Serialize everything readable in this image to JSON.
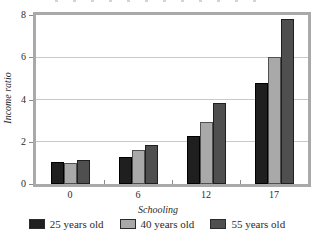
{
  "chart_data": {
    "type": "bar",
    "title": "",
    "categories": [
      "0",
      "6",
      "12",
      "17"
    ],
    "series": [
      {
        "name": "25 years old",
        "color": "#1f1f1f",
        "border_color": "#000000",
        "values": [
          1.05,
          1.3,
          2.25,
          4.8
        ]
      },
      {
        "name": "40 years old",
        "color": "#a9a9a9",
        "border_color": "#505050",
        "values": [
          1.0,
          1.6,
          2.95,
          6.0
        ]
      },
      {
        "name": "55 years old",
        "color": "#4f4f4f",
        "border_color": "#1f1f1f",
        "values": [
          1.15,
          1.85,
          3.85,
          7.8
        ]
      }
    ],
    "xlabel": "Schooling",
    "ylabel": "Income ratio",
    "ylim": [
      0,
      8
    ],
    "yticks": [
      0,
      2,
      4,
      6,
      8
    ],
    "gridlines": [
      2,
      4,
      6
    ],
    "grid": true,
    "legend_position": "bottom",
    "frame_color": "#a9a9a9",
    "gridline_color": "#c9c9c9",
    "tick_color": "#8a8a8a",
    "text_color": "#2b2b2b"
  }
}
